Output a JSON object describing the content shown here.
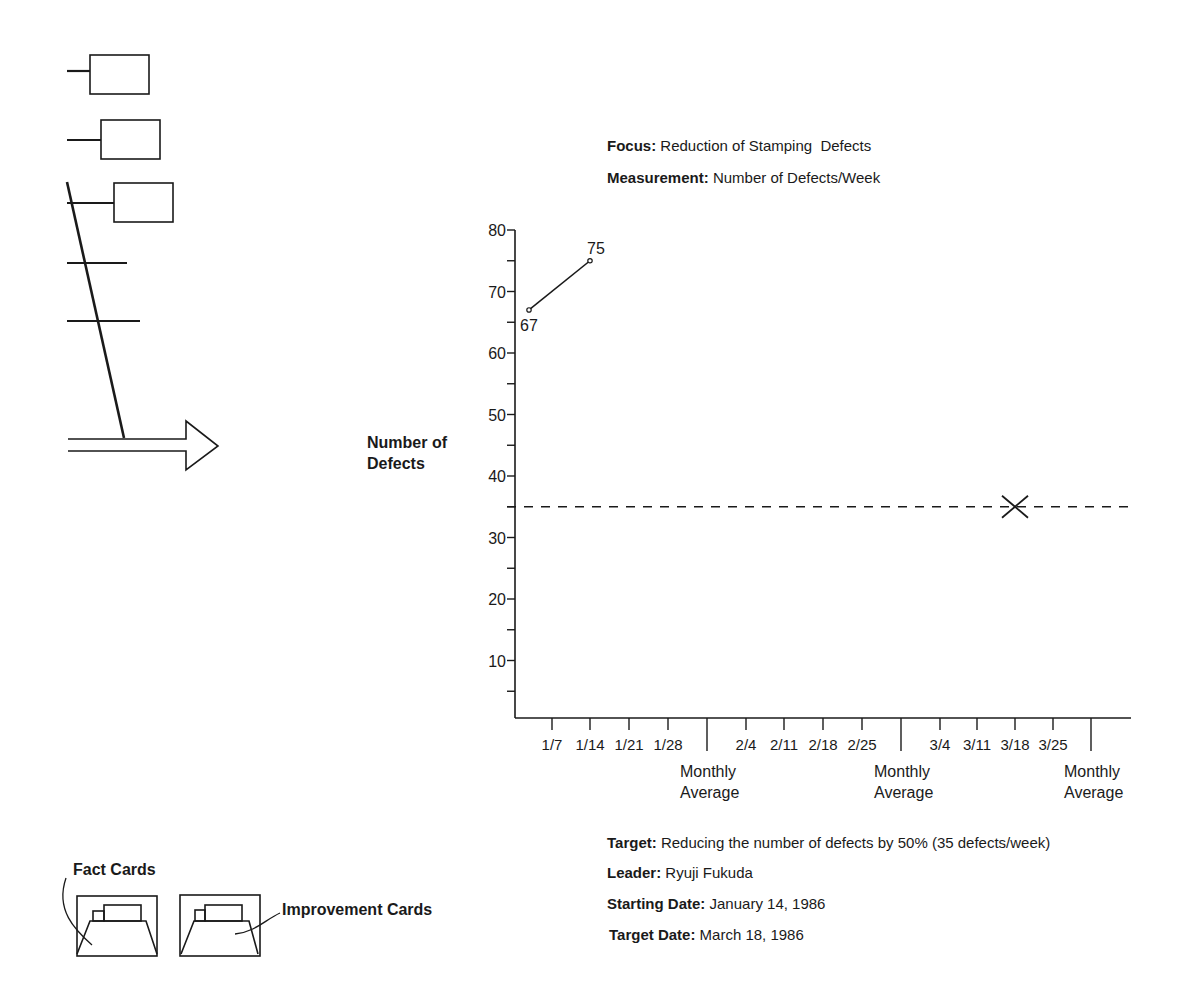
{
  "header": {
    "focus_label": "Focus:",
    "focus_value": "Reduction of Stamping  Defects",
    "measurement_label": "Measurement:",
    "measurement_value": "Number of Defects/Week"
  },
  "y_axis_title_line1": "Number of",
  "y_axis_title_line2": "Defects",
  "footer": {
    "target_label": "Target:",
    "target_value": "Reducing the number of defects by 50% (35 defects/week)",
    "leader_label": "Leader:",
    "leader_value": "Ryuji Fukuda",
    "start_label": "Starting Date:",
    "start_value": "January 14, 1986",
    "target_date_label": "Target Date:",
    "target_date_value": "March 18, 1986"
  },
  "cards": {
    "fact_label": "Fact Cards",
    "improvement_label": "Improvement Cards"
  },
  "chart_data": {
    "type": "line",
    "title": "Focus: Reduction of Stamping Defects",
    "subtitle": "Measurement: Number of Defects/Week",
    "xlabel": "",
    "ylabel": "Number of Defects",
    "ylim": [
      0,
      80
    ],
    "y_ticks": [
      10,
      20,
      30,
      40,
      50,
      60,
      70,
      80
    ],
    "categories": [
      "1/7",
      "1/14",
      "1/21",
      "1/28",
      "Monthly Average",
      "2/4",
      "2/11",
      "2/18",
      "2/25",
      "Monthly Average",
      "3/4",
      "3/11",
      "3/18",
      "3/25",
      "Monthly Average"
    ],
    "series": [
      {
        "name": "Defects/Week",
        "x": [
          "1/7",
          "1/14"
        ],
        "values": [
          67,
          75
        ],
        "point_labels": [
          "67",
          "75"
        ]
      }
    ],
    "target_line": {
      "value": 35,
      "style": "dashed",
      "label": "Target 35 defects/week"
    },
    "target_marker": {
      "x": "3/18",
      "y": 35,
      "symbol": "X"
    },
    "grid": false,
    "legend": "none"
  }
}
